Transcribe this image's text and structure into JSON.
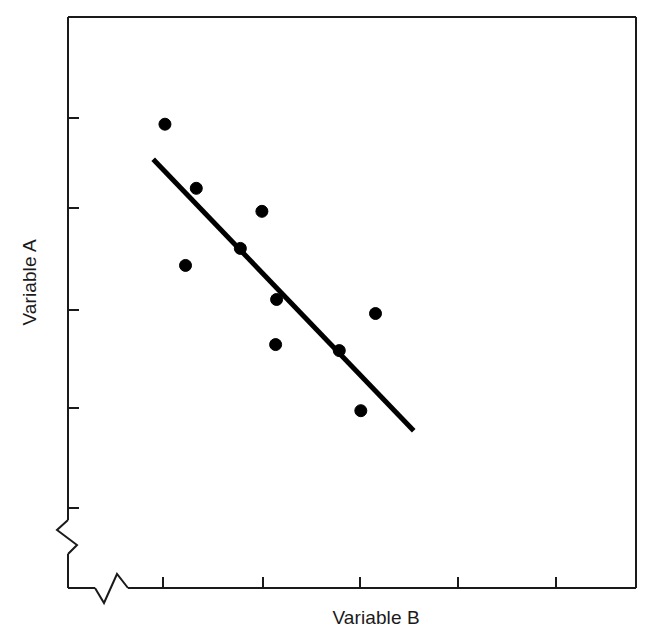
{
  "chart_data": {
    "type": "scatter",
    "title": "",
    "xlabel": "Variable B",
    "ylabel": "Variable A",
    "grid": false,
    "legend": null,
    "axis_break": {
      "x": true,
      "y": true,
      "style": "zigzag"
    },
    "xlim": [
      0,
      5.8
    ],
    "ylim": [
      0,
      5.7
    ],
    "xticks": [
      1,
      2,
      3,
      4,
      5
    ],
    "yticks": [
      1,
      2,
      3,
      4,
      5
    ],
    "xtick_labels": [
      "",
      "",
      "",
      "",
      ""
    ],
    "ytick_labels": [
      "",
      "",
      "",
      "",
      ""
    ],
    "points": [
      {
        "x": 0.99,
        "y": 4.63
      },
      {
        "x": 1.31,
        "y": 3.99
      },
      {
        "x": 1.98,
        "y": 3.76
      },
      {
        "x": 1.76,
        "y": 3.39
      },
      {
        "x": 1.2,
        "y": 3.22
      },
      {
        "x": 2.13,
        "y": 2.88
      },
      {
        "x": 3.14,
        "y": 2.74
      },
      {
        "x": 2.12,
        "y": 2.43
      },
      {
        "x": 2.77,
        "y": 2.37
      },
      {
        "x": 2.99,
        "y": 1.77
      }
    ],
    "point_style": {
      "marker": "circle",
      "filled": true,
      "color": "#000000",
      "radius_px": 6
    },
    "fit_line": {
      "label": "linear trend",
      "from": {
        "x": 0.87,
        "y": 4.28
      },
      "to": {
        "x": 3.53,
        "y": 1.57
      },
      "color": "#000000",
      "width_px": 5,
      "slope_sign": "negative"
    }
  },
  "axes": {
    "frame": {
      "left_px": 68,
      "top_px": 17,
      "right_px": 636,
      "bottom_px": 588,
      "color": "#1a1a1a",
      "width_px": 2
    },
    "x_tick_px": [
      163,
      263,
      360,
      458,
      556
    ],
    "y_tick_px": [
      118,
      208,
      310,
      408,
      508
    ],
    "tick_length_px": 11,
    "x_break_px": 110,
    "y_break_px": 536
  },
  "labels": {
    "y_axis": "Variable A",
    "x_axis": "Variable B"
  }
}
